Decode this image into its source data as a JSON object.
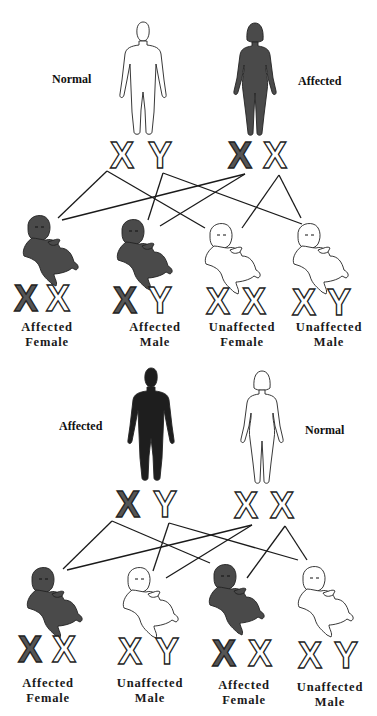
{
  "colors": {
    "affected_fill": "#4a4a4a",
    "affected_male_fill": "#1e1e1e",
    "normal_fill": "#ffffff",
    "outline": "#222222",
    "affected_chromosome": "#555555",
    "line": "#1a1a1a"
  },
  "crosses": [
    {
      "name": "cross-normal-father-affected-mother",
      "parents": [
        {
          "role": "father",
          "sex": "male",
          "status_label": "Normal",
          "affected": false,
          "chromosomes": [
            {
              "letter": "X",
              "affected": false
            },
            {
              "letter": "Y",
              "affected": false
            }
          ]
        },
        {
          "role": "mother",
          "sex": "female",
          "status_label": "Affected",
          "affected": true,
          "chromosomes": [
            {
              "letter": "X",
              "affected": true
            },
            {
              "letter": "X",
              "affected": false
            }
          ]
        }
      ],
      "children": [
        {
          "affected": true,
          "label_line1": "Affected",
          "label_line2": "Female",
          "chromosomes": [
            {
              "letter": "X",
              "affected": true
            },
            {
              "letter": "X",
              "affected": false
            }
          ]
        },
        {
          "affected": true,
          "label_line1": "Affected",
          "label_line2": "Male",
          "chromosomes": [
            {
              "letter": "X",
              "affected": true
            },
            {
              "letter": "Y",
              "affected": false
            }
          ]
        },
        {
          "affected": false,
          "label_line1": "Unaffected",
          "label_line2": "Female",
          "chromosomes": [
            {
              "letter": "X",
              "affected": false
            },
            {
              "letter": "X",
              "affected": false
            }
          ]
        },
        {
          "affected": false,
          "label_line1": "Unaffected",
          "label_line2": "Male",
          "chromosomes": [
            {
              "letter": "X",
              "affected": false
            },
            {
              "letter": "Y",
              "affected": false
            }
          ]
        }
      ]
    },
    {
      "name": "cross-affected-father-normal-mother",
      "parents": [
        {
          "role": "father",
          "sex": "male",
          "status_label": "Affected",
          "affected": true,
          "chromosomes": [
            {
              "letter": "X",
              "affected": true
            },
            {
              "letter": "Y",
              "affected": false
            }
          ]
        },
        {
          "role": "mother",
          "sex": "female",
          "status_label": "Normal",
          "affected": false,
          "chromosomes": [
            {
              "letter": "X",
              "affected": false
            },
            {
              "letter": "X",
              "affected": false
            }
          ]
        }
      ],
      "children": [
        {
          "affected": true,
          "label_line1": "Affected",
          "label_line2": "Female",
          "chromosomes": [
            {
              "letter": "X",
              "affected": true
            },
            {
              "letter": "X",
              "affected": false
            }
          ]
        },
        {
          "affected": false,
          "label_line1": "Unaffected",
          "label_line2": "Male",
          "chromosomes": [
            {
              "letter": "X",
              "affected": false
            },
            {
              "letter": "Y",
              "affected": false
            }
          ]
        },
        {
          "affected": true,
          "label_line1": "Affected",
          "label_line2": "Female",
          "chromosomes": [
            {
              "letter": "X",
              "affected": true
            },
            {
              "letter": "X",
              "affected": false
            }
          ]
        },
        {
          "affected": false,
          "label_line1": "Unaffected",
          "label_line2": "Male",
          "chromosomes": [
            {
              "letter": "X",
              "affected": false
            },
            {
              "letter": "Y",
              "affected": false
            }
          ]
        }
      ]
    }
  ]
}
